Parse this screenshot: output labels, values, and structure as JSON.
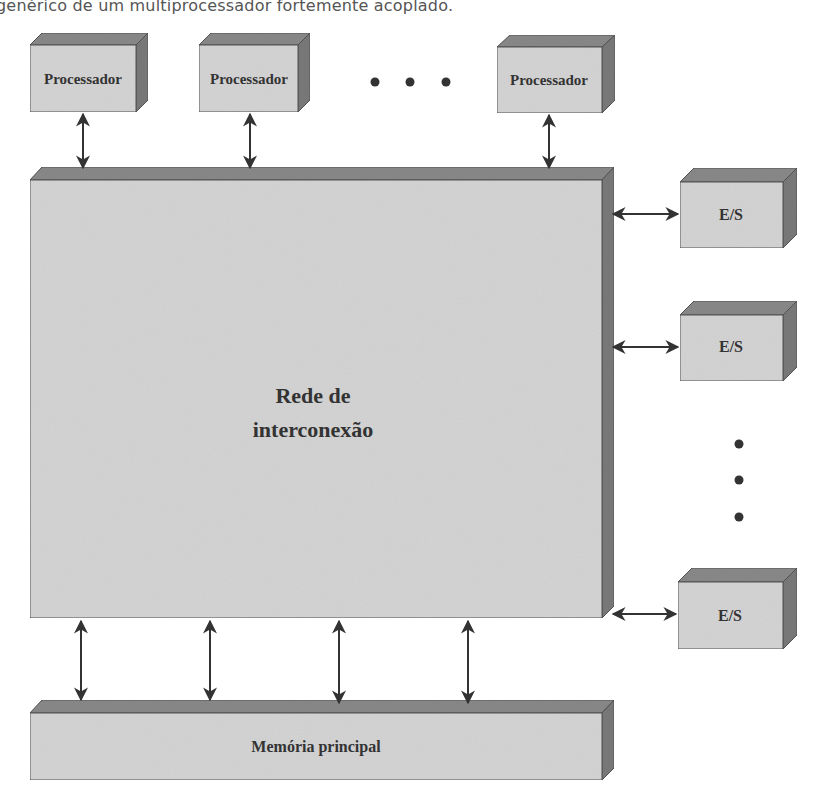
{
  "caption": "genérico de um multiprocessador fortemente acoplado.",
  "colors": {
    "front": "#d6d6d6",
    "top": "#8a8a8a",
    "side": "#7a7a7a",
    "text": "#333333",
    "arrow": "#333333"
  },
  "diagram": {
    "processors": [
      {
        "label": "Processador"
      },
      {
        "label": "Processador"
      },
      {
        "label": "Processador"
      }
    ],
    "processor_ellipsis": "• • •",
    "interconnect": {
      "line1": "Rede de",
      "line2": "interconexão"
    },
    "io_devices": [
      {
        "label": "E/S"
      },
      {
        "label": "E/S"
      },
      {
        "label": "E/S"
      }
    ],
    "io_ellipsis": "⋮",
    "memory": {
      "label": "Memória principal"
    },
    "memory_links": 4
  }
}
